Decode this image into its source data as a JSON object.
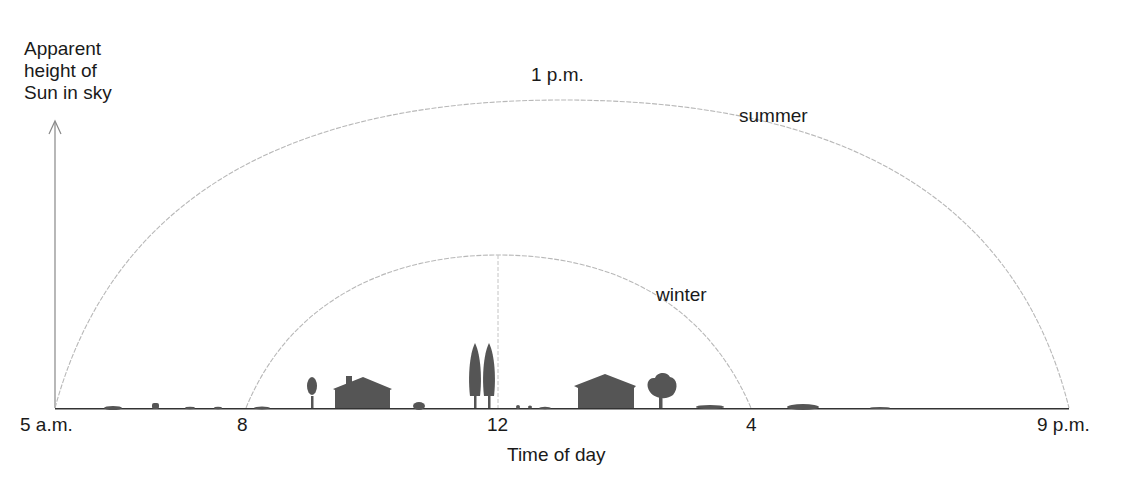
{
  "diagram": {
    "y_axis_label": [
      "Apparent",
      "height of",
      "Sun in sky"
    ],
    "x_axis_label": "Time of day",
    "x_ticks": [
      {
        "label": "5 a.m.",
        "x": 54
      },
      {
        "label": "8",
        "x": 245
      },
      {
        "label": "12",
        "x": 498
      },
      {
        "label": "4",
        "x": 750
      },
      {
        "label": "9 p.m.",
        "x": 1069
      }
    ],
    "arcs": [
      {
        "name": "summer",
        "label": "summer",
        "start": "5 a.m.",
        "end": "9 p.m.",
        "peak_label": "1 p.m.",
        "color": "#b8b8b8"
      },
      {
        "name": "winter",
        "label": "winter",
        "start": "8",
        "end": "4",
        "peak_at": "12",
        "color": "#b8b8b8"
      }
    ],
    "peak_label": "1 p.m.",
    "colors": {
      "ground": "#333333",
      "silhouette": "#555555",
      "arc": "#b5b5b5",
      "axis": "#777777"
    }
  }
}
